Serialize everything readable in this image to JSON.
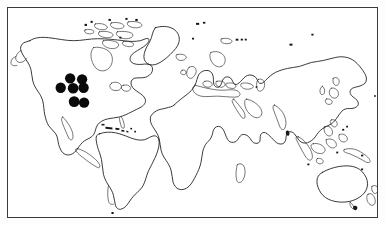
{
  "figure": {
    "kind": "world-distribution-map",
    "title": "World map with occurrence records",
    "width": 385,
    "height": 225,
    "background_color": "#fdfdfd",
    "map_background_color": "#ffffff",
    "border_color": "#3a3a3a",
    "coastline_color": "#151515",
    "dot_color": "#0a0a0a",
    "projection_note": "equirectangular world outline",
    "caption": ""
  },
  "frame": {
    "x": 7,
    "y": 7,
    "width": 371,
    "height": 211,
    "stroke_width": 1.5
  },
  "legend": {
    "present": false,
    "entries": []
  },
  "labels": {
    "present": false,
    "items": []
  },
  "record_dots": {
    "count": 7,
    "radius": 5.2,
    "region": "western North America",
    "points": [
      {
        "id": "dot-1",
        "cx": 62.5,
        "cy": 71.0,
        "r": 5.2
      },
      {
        "id": "dot-2",
        "cx": 74.5,
        "cy": 72.0,
        "r": 5.2
      },
      {
        "id": "dot-3",
        "cx": 53.0,
        "cy": 80.5,
        "r": 5.2
      },
      {
        "id": "dot-4",
        "cx": 65.5,
        "cy": 81.0,
        "r": 5.4
      },
      {
        "id": "dot-5",
        "cx": 76.0,
        "cy": 80.5,
        "r": 5.2
      },
      {
        "id": "dot-6",
        "cx": 66.5,
        "cy": 94.5,
        "r": 5.4
      },
      {
        "id": "dot-7",
        "cx": 76.5,
        "cy": 95.5,
        "r": 5.2
      }
    ]
  },
  "landmasses": [
    {
      "id": "north-america",
      "name": "North America"
    },
    {
      "id": "greenland",
      "name": "Greenland"
    },
    {
      "id": "arctic-islands",
      "name": "Canadian Arctic Archipelago"
    },
    {
      "id": "south-america",
      "name": "South America"
    },
    {
      "id": "central-america-caribbean",
      "name": "Central America and Caribbean"
    },
    {
      "id": "eurasia-africa",
      "name": "Eurasia and Africa"
    },
    {
      "id": "british-isles",
      "name": "British Isles"
    },
    {
      "id": "iceland",
      "name": "Iceland"
    },
    {
      "id": "scandinavia",
      "name": "Scandinavia"
    },
    {
      "id": "madagascar",
      "name": "Madagascar"
    },
    {
      "id": "japan",
      "name": "Japan"
    },
    {
      "id": "sri-lanka",
      "name": "Sri Lanka"
    },
    {
      "id": "southeast-asia-islands",
      "name": "Indonesia and Philippines"
    },
    {
      "id": "new-guinea",
      "name": "New Guinea"
    },
    {
      "id": "australia",
      "name": "Australia"
    },
    {
      "id": "new-zealand",
      "name": "New Zealand"
    },
    {
      "id": "tasmania",
      "name": "Tasmania"
    },
    {
      "id": "svalbard",
      "name": "Svalbard"
    }
  ]
}
